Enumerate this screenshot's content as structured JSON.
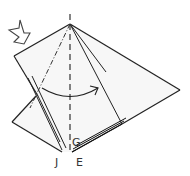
{
  "diagram": {
    "type": "origami-fold-step",
    "labels": {
      "G": "G",
      "J": "J",
      "E": "E"
    },
    "symbols": {
      "push_arrow": "hollow-push-arrow",
      "fold_arrow": "curved-fold-arrow",
      "valley_fold": "dashed-line",
      "mountain_fold": "dash-dot-line"
    },
    "colors": {
      "paper": "#f7f7f7",
      "line": "#222222",
      "label": "#333333"
    }
  }
}
